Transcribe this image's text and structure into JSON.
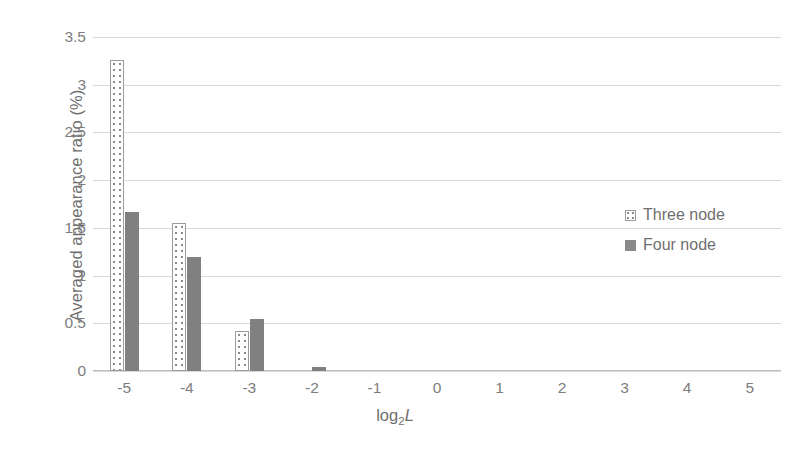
{
  "chart_data": {
    "type": "bar",
    "title": "",
    "subtitle": "",
    "xlabel": "log2L",
    "xlabel_parts": {
      "main": "log",
      "sub": "2",
      "var": "L"
    },
    "ylabel": "Averaged appearance ratio (%)",
    "categories": [
      "-5",
      "-4",
      "-3",
      "-2",
      "-1",
      "0",
      "1",
      "2",
      "3",
      "4",
      "5"
    ],
    "series": [
      {
        "name": "Three node",
        "pattern": "dotted",
        "color": "#ffffff",
        "outline": "#9b9b9b",
        "values": [
          3.26,
          1.55,
          0.42,
          0,
          0,
          0,
          0,
          0,
          0,
          0,
          0
        ]
      },
      {
        "name": "Four node",
        "pattern": "solid",
        "color": "#808080",
        "outline": "#808080",
        "values": [
          1.67,
          1.2,
          0.54,
          0.04,
          0,
          0,
          0,
          0,
          0,
          0,
          0
        ]
      }
    ],
    "ylim": [
      0,
      3.5
    ],
    "yticks": [
      "0",
      "0.5",
      "1",
      "1.5",
      "2",
      "2.5",
      "3",
      "3.5"
    ],
    "ytick_values": [
      0,
      0.5,
      1,
      1.5,
      2,
      2.5,
      3,
      3.5
    ],
    "grid": true,
    "legend_position": "right-middle",
    "legend": [
      {
        "label": "Three node",
        "swatch": "dotted-square-swatch"
      },
      {
        "label": "Four node",
        "swatch": "solid-gray-square-swatch"
      }
    ]
  },
  "colors": {
    "gridline": "#d9d9d9",
    "axis": "#bfbfbf",
    "text": "#7d7d7d",
    "series_four": "#808080",
    "series_three_outline": "#9b9b9b"
  }
}
